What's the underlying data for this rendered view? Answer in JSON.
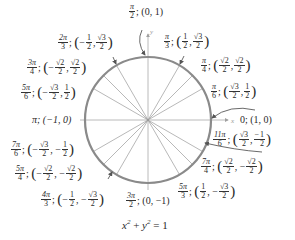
{
  "diagram": {
    "equation": "x² + y² = 1",
    "axis_labels": {
      "x": "x",
      "y": "y"
    },
    "colors": {
      "circle": "#8a8a8a",
      "spokes": "#9a9a9a",
      "axes": "#a0a0a0",
      "text": "#2a2a2a"
    },
    "center_px": [
      148,
      120
    ],
    "radius_px": 63,
    "points": [
      {
        "angle": "0",
        "angle_deg": 0,
        "coords": "(1, 0)"
      },
      {
        "angle": "π/6",
        "angle_deg": 30,
        "coords": "(√3/2, 1/2)"
      },
      {
        "angle": "π/4",
        "angle_deg": 45,
        "coords": "(√2/2, √2/2)"
      },
      {
        "angle": "π/3",
        "angle_deg": 60,
        "coords": "(1/2, √3/2)"
      },
      {
        "angle": "π/2",
        "angle_deg": 90,
        "coords": "(0, 1)"
      },
      {
        "angle": "2π/3",
        "angle_deg": 120,
        "coords": "(−1/2, √3/2)"
      },
      {
        "angle": "3π/4",
        "angle_deg": 135,
        "coords": "(−√2/2, √2/2)"
      },
      {
        "angle": "5π/6",
        "angle_deg": 150,
        "coords": "(−√3/2, 1/2)"
      },
      {
        "angle": "π",
        "angle_deg": 180,
        "coords": "(−1, 0)"
      },
      {
        "angle": "7π/6",
        "angle_deg": 210,
        "coords": "(−√3/2, −1/2)"
      },
      {
        "angle": "5π/4",
        "angle_deg": 225,
        "coords": "(−√2/2, −√2/2)"
      },
      {
        "angle": "4π/3",
        "angle_deg": 240,
        "coords": "(−1/2, −√3/2)"
      },
      {
        "angle": "3π/2",
        "angle_deg": 270,
        "coords": "(0, −1)"
      },
      {
        "angle": "5π/3",
        "angle_deg": 300,
        "coords": "(1/2, −√3/2)"
      },
      {
        "angle": "7π/4",
        "angle_deg": 315,
        "coords": "(√2/2, −√2/2)"
      },
      {
        "angle": "11π/6",
        "angle_deg": 330,
        "coords": "(√3/2, −1/2)"
      }
    ]
  },
  "text": {
    "pi": "π",
    "zero": "0",
    "sep": ";",
    "comma": ",",
    "lp": "(",
    "rp": ")",
    "one": "1",
    "two": "2",
    "three": "3",
    "four": "4",
    "five": "5",
    "six": "6",
    "seven": "7",
    "r2": "√2",
    "r3": "√3",
    "minus": "−",
    "n2pi": "2π",
    "n3pi": "3π",
    "n4pi": "4π",
    "n5pi": "5π",
    "n7pi": "7π",
    "n11pi": "11π",
    "c10": "(1, 0)",
    "c01": "(0, 1)",
    "cm10": "π; (−1, 0)",
    "c0m1": "(0, −1)",
    "eq_x": "x",
    "eq_plus": " + ",
    "eq_y": "y",
    "eq_sq": "2",
    "eq_rhs": " = 1"
  }
}
